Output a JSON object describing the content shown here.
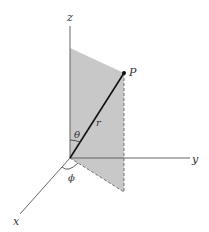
{
  "diagram": {
    "labels": {
      "z_axis": "z",
      "y_axis": "y",
      "x_axis": "x",
      "point": "P",
      "radius": "r",
      "polar_angle": "θ",
      "azimuth_angle": "ϕ"
    },
    "colors": {
      "plane_fill": "#c8c8c8",
      "axis": "#555555",
      "radius_line": "#111111",
      "dashed": "#666666",
      "background": "#ffffff"
    }
  }
}
